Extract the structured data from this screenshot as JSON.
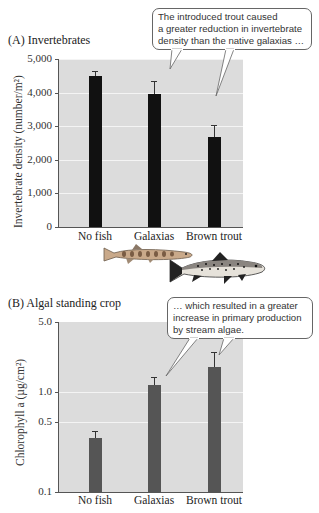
{
  "panel_a": {
    "title": "(A)  Invertebrates",
    "ylabel": "Invertebrate density (number/m²)",
    "yticks": [
      "5,000",
      "4,000",
      "3,000",
      "2,000",
      "1,000",
      "0"
    ],
    "categories": [
      "No fish",
      "Galaxias",
      "Brown trout"
    ],
    "callout": [
      "The introduced trout caused",
      "a greater reduction in invertebrate",
      "density than the native galaxias …"
    ]
  },
  "panel_b": {
    "title": "(B)  Algal standing crop",
    "ylabel": "Chlorophyll a (µg/cm²)",
    "yticks": [
      "5.0",
      "1.0",
      "0.5",
      "0.1"
    ],
    "categories": [
      "No fish",
      "Galaxias",
      "Brown trout"
    ],
    "callout": [
      "… which resulted in a greater",
      "increase in primary production",
      "by stream algae."
    ]
  },
  "illustrations": {
    "fish_1": "galaxias-fish",
    "fish_2": "brown-trout-fish"
  },
  "colors": {
    "plot_background": "#dcdcdc",
    "gridline": "#f4f4f4",
    "bar_a": "#111111",
    "bar_b": "#555555",
    "callout_border": "#666666"
  },
  "chart_data": [
    {
      "type": "bar",
      "title": "(A) Invertebrates",
      "xlabel": "",
      "ylabel": "Invertebrate density (number/m²)",
      "categories": [
        "No fish",
        "Galaxias",
        "Brown trout"
      ],
      "values": [
        4500,
        3950,
        2680
      ],
      "error_upper": [
        4650,
        4360,
        3040
      ],
      "ylim": [
        0,
        5000
      ],
      "yticks": [
        0,
        1000,
        2000,
        3000,
        4000,
        5000
      ],
      "grid": true,
      "legend": null,
      "annotation": "The introduced trout caused a greater reduction in invertebrate density than the native galaxias …"
    },
    {
      "type": "bar",
      "title": "(B) Algal standing crop",
      "xlabel": "",
      "ylabel": "Chlorophyll a (µg/cm²)",
      "yscale": "log",
      "categories": [
        "No fish",
        "Galaxias",
        "Brown trout"
      ],
      "values": [
        0.35,
        1.17,
        1.79
      ],
      "error_upper": [
        0.41,
        1.4,
        2.5
      ],
      "ylim": [
        0.1,
        5.0
      ],
      "yticks": [
        0.1,
        0.5,
        1.0,
        5.0
      ],
      "grid": true,
      "legend": null,
      "annotation": "… which resulted in a greater increase in primary production by stream algae."
    }
  ]
}
